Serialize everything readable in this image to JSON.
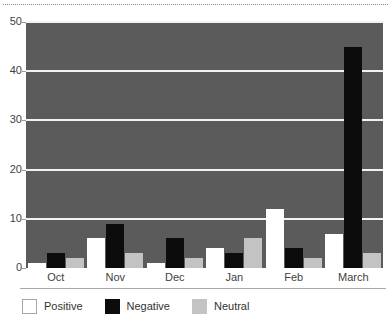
{
  "chart_data": {
    "type": "bar",
    "title": "",
    "subtitle": "",
    "xlabel": "",
    "ylabel": "",
    "categories": [
      "Oct",
      "Nov",
      "Dec",
      "Jan",
      "Feb",
      "March"
    ],
    "series": [
      {
        "name": "Positive",
        "color": "#ffffff",
        "values": [
          1,
          6,
          1,
          4,
          12,
          7
        ]
      },
      {
        "name": "Negative",
        "color": "#0c0c0c",
        "values": [
          3,
          9,
          6,
          3,
          4,
          45
        ]
      },
      {
        "name": "Neutral",
        "color": "#c3c3c3",
        "values": [
          2,
          3,
          2,
          6,
          2,
          3
        ]
      }
    ],
    "ylim": [
      0,
      50
    ],
    "yticks": [
      0,
      10,
      20,
      30,
      40,
      50
    ],
    "ytick_labels": [
      "0",
      "10",
      "20",
      "30",
      "40",
      "50"
    ],
    "grid": true,
    "grid_color": "#f2f2f2",
    "plot_background": "#5b5b5b",
    "legend_position": "bottom-left",
    "legend": [
      "Positive",
      "Negative",
      "Neutral"
    ]
  },
  "axes": {
    "y_ticks": [
      "50",
      "40",
      "30",
      "20",
      "10",
      "0"
    ],
    "x_ticks": [
      "Oct",
      "Nov",
      "Dec",
      "Jan",
      "Feb",
      "March"
    ]
  },
  "legend": {
    "items": [
      {
        "label": "Positive",
        "swatch": "positive-swatch"
      },
      {
        "label": "Negative",
        "swatch": "negative-swatch"
      },
      {
        "label": "Neutral",
        "swatch": "neutral-swatch"
      }
    ]
  }
}
